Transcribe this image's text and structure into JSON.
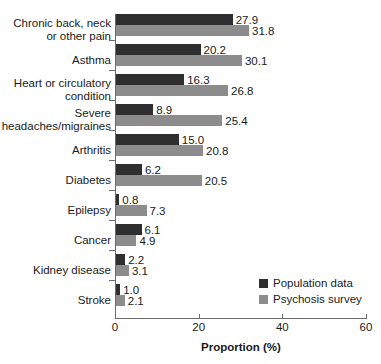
{
  "chart_data": {
    "type": "bar",
    "orientation": "horizontal",
    "title": "",
    "xlabel": "Proportion (%)",
    "ylabel": "",
    "xlim": [
      0,
      60
    ],
    "xticks": [
      0,
      20,
      40,
      60
    ],
    "grid": false,
    "legend_position": "lower-right-inside",
    "categories": [
      "Chronic back, neck\nor other pain",
      "Asthma",
      "Heart or circulatory\ncondition",
      "Severe\nheadaches/migraines",
      "Arthritis",
      "Diabetes",
      "Epilepsy",
      "Cancer",
      "Kidney disease",
      "Stroke"
    ],
    "series": [
      {
        "name": "Population data",
        "color": "#2f2f2f",
        "values": [
          27.9,
          20.2,
          16.3,
          8.9,
          15.0,
          6.2,
          0.8,
          6.1,
          2.2,
          1.0
        ],
        "labels": [
          "27.9",
          "20.2",
          "16.3",
          "8.9",
          "15.0",
          "6.2",
          "0.8",
          "6.1",
          "2.2",
          "1.0"
        ]
      },
      {
        "name": "Psychosis survey",
        "color": "#8c8c8c",
        "values": [
          31.8,
          30.1,
          26.8,
          25.4,
          20.8,
          20.5,
          7.3,
          4.9,
          3.1,
          2.1
        ],
        "labels": [
          "31.8",
          "30.1",
          "26.8",
          "25.4",
          "20.8",
          "20.5",
          "7.3",
          "4.9",
          "3.1",
          "2.1"
        ]
      }
    ]
  },
  "legend": {
    "items": [
      {
        "label": "Population data"
      },
      {
        "label": "Psychosis survey"
      }
    ]
  },
  "axis": {
    "x_title": "Proportion (%)",
    "x_tick_labels": [
      "0",
      "20",
      "40",
      "60"
    ]
  }
}
